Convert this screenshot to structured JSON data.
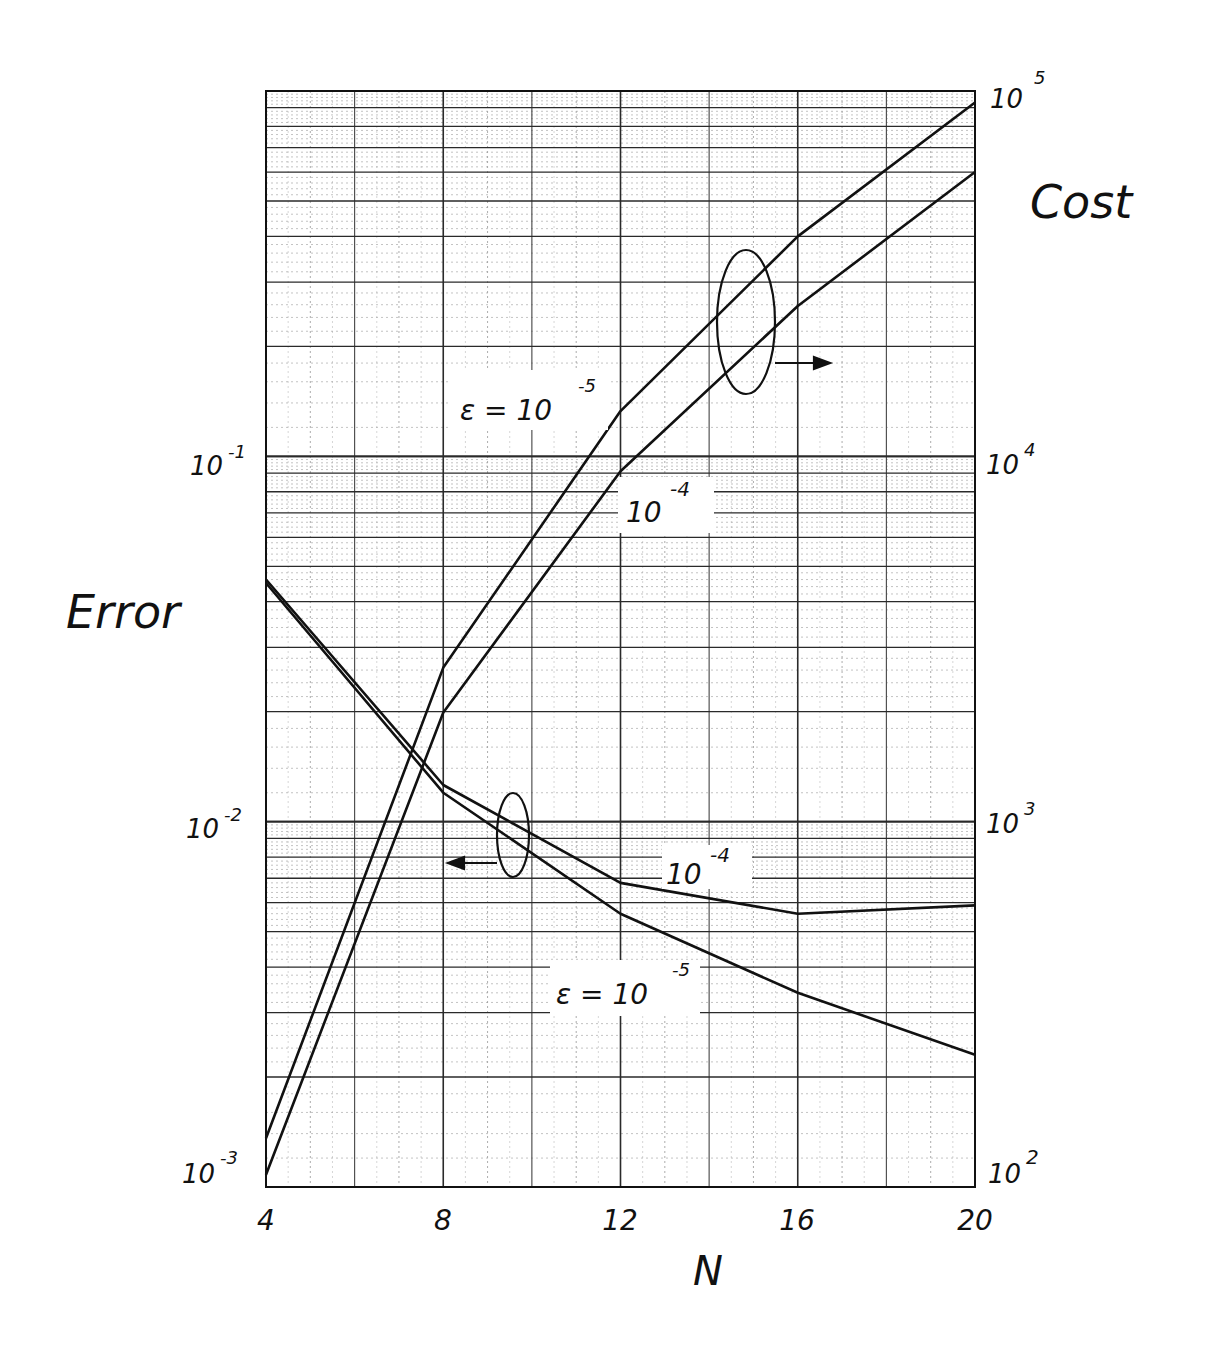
{
  "chart_data": {
    "type": "line",
    "title": "",
    "xlabel": "N",
    "ylabel_left": "Error",
    "ylabel_right": "Cost",
    "x": [
      4,
      8,
      12,
      16,
      20
    ],
    "x_ticks": [
      "4",
      "8",
      "12",
      "16",
      "20"
    ],
    "xlim": [
      4,
      20
    ],
    "y_left_scale": "log",
    "y_left_lim": [
      0.001,
      1
    ],
    "y_left_ticks": [
      {
        "base": "10",
        "exp": "-1",
        "value": 0.1
      },
      {
        "base": "10",
        "exp": "-2",
        "value": 0.01
      },
      {
        "base": "10",
        "exp": "-3",
        "value": 0.001
      }
    ],
    "y_right_scale": "log",
    "y_right_lim": [
      100,
      100000
    ],
    "y_right_ticks": [
      {
        "base": "10",
        "exp": "5",
        "value": 100000
      },
      {
        "base": "10",
        "exp": "4",
        "value": 10000
      },
      {
        "base": "10",
        "exp": "3",
        "value": 1000
      },
      {
        "base": "10",
        "exp": "2",
        "value": 100
      }
    ],
    "grid": true,
    "series": [
      {
        "name": "Cost, ε = 10^-5",
        "axis": "right",
        "values": [
          136,
          2640,
          13300,
          40000,
          93000
        ]
      },
      {
        "name": "Cost, ε = 10^-4",
        "axis": "right",
        "values": [
          108,
          1990,
          9100,
          25800,
          60000
        ]
      },
      {
        "name": "Error, ε = 10^-4",
        "axis": "left",
        "values": [
          0.046,
          0.0126,
          0.0068,
          0.0056,
          0.0059
        ]
      },
      {
        "name": "Error, ε = 10^-5",
        "axis": "left",
        "values": [
          0.045,
          0.012,
          0.0056,
          0.0034,
          0.0023
        ]
      }
    ],
    "annotations": [
      {
        "text": "ε = 10^-5",
        "target": "Cost, ε = 10^-5"
      },
      {
        "text": "10^-4",
        "target": "Cost, ε = 10^-4"
      },
      {
        "text": "10^-4",
        "target": "Error, ε = 10^-4"
      },
      {
        "text": "ε = 10^-5",
        "target": "Error, ε = 10^-5"
      },
      {
        "text": "→ (cost curves read on right axis)",
        "type": "ellipse-arrow-right"
      },
      {
        "text": "← (error curves read on left axis)",
        "type": "ellipse-arrow-left"
      }
    ]
  },
  "labels": {
    "error": "Error",
    "cost": "Cost",
    "n": "N",
    "eps_prefix": "ε = 10",
    "ten": "10",
    "exp_m5": "-5",
    "exp_m4": "-4"
  },
  "style": {
    "ink": "#111111",
    "grid_major": "#2a2a2a",
    "grid_minor": "#9a9a9a",
    "background": "#ffffff"
  }
}
